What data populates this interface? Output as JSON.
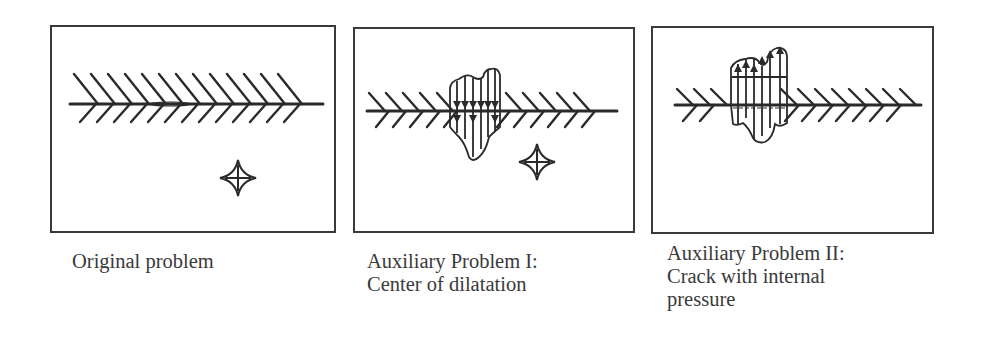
{
  "figure": {
    "panels": [
      {
        "id": "original",
        "caption_lines": [
          "Original problem"
        ],
        "elements": [
          "crack",
          "center-of-dilatation"
        ]
      },
      {
        "id": "auxiliary-1",
        "caption_lines": [
          "Auxiliary Problem I:",
          "Center of dilatation"
        ],
        "elements": [
          "crack",
          "crack-face-traction-downward",
          "center-of-dilatation"
        ]
      },
      {
        "id": "auxiliary-2",
        "caption_lines": [
          "Auxiliary Problem II:",
          "Crack with internal",
          "pressure"
        ],
        "elements": [
          "crack",
          "crack-face-pressure-upward"
        ]
      }
    ],
    "colors": {
      "line": "#2a2a2a",
      "frame": "#3a3a3a",
      "background": "#ffffff"
    }
  }
}
